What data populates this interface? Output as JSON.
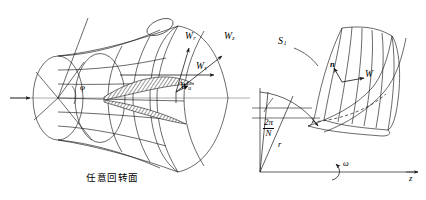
{
  "figure": {
    "background_color": "#ffffff",
    "line_color": "#1a1a1a"
  },
  "left_panel": {
    "caption": "任意回转面",
    "angle_label": "φ",
    "vectors": [
      {
        "id": "Wr",
        "base": "W",
        "sub": "r",
        "meaning": "radial-component"
      },
      {
        "id": "Wz",
        "base": "W",
        "sub": "z",
        "meaning": "axial-component"
      },
      {
        "id": "Ws",
        "base": "W",
        "sub": "s",
        "meaning": "meridional-component"
      },
      {
        "id": "Wu",
        "base": "W",
        "sub": "u",
        "meaning": "circumferential-component"
      }
    ]
  },
  "right_panel": {
    "surface_label": {
      "base": "S",
      "sub": "1"
    },
    "normal_label": "n",
    "velocity_label": "W",
    "radius_label": "r",
    "pitch_angle": {
      "numerator": "2π",
      "denominator": "N"
    },
    "axis_z_label": "z",
    "omega_label": "ω"
  }
}
